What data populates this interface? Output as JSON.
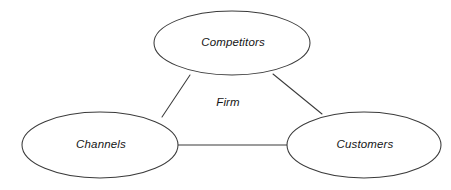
{
  "diagram": {
    "background_color": "#ffffff",
    "stroke_color": "#3b3b3b",
    "text_color": "#151515",
    "center_label": {
      "text": "Firm",
      "x": 228,
      "y": 103
    },
    "nodes": [
      {
        "id": "competitors",
        "label": "Competitors",
        "cx": 232,
        "cy": 43,
        "rx": 78,
        "ry": 32,
        "label_x": 233,
        "label_y": 43
      },
      {
        "id": "channels",
        "label": "Channels",
        "cx": 100,
        "cy": 145,
        "rx": 78,
        "ry": 33,
        "label_x": 101,
        "label_y": 145
      },
      {
        "id": "customers",
        "label": "Customers",
        "cx": 364,
        "cy": 145,
        "rx": 77,
        "ry": 33,
        "label_x": 365,
        "label_y": 145
      }
    ],
    "connectors": [
      {
        "id": "competitors-to-channels",
        "from": "competitors",
        "to": "channels",
        "x1": 190,
        "y1": 75,
        "x2": 162,
        "y2": 117
      },
      {
        "id": "competitors-to-customers",
        "from": "competitors",
        "to": "customers",
        "x1": 273,
        "y1": 74,
        "x2": 322,
        "y2": 114
      },
      {
        "id": "channels-to-customers",
        "from": "channels",
        "to": "customers",
        "x1": 178,
        "y1": 145,
        "x2": 287,
        "y2": 145
      }
    ]
  }
}
